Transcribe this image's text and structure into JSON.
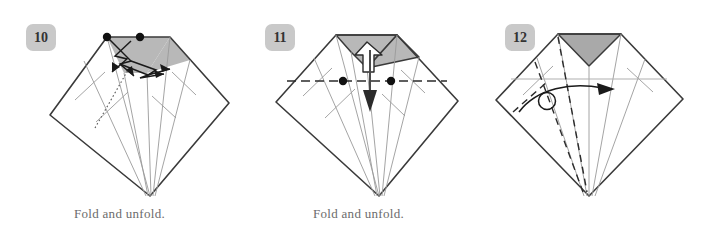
{
  "page": {
    "background_color": "#ffffff",
    "width": 718,
    "height": 242
  },
  "colors": {
    "outline": "#3a3a3a",
    "crease_light": "#9a9a9a",
    "shaded_fill": "#b8b8b8",
    "shaded_fill_dark": "#a9a9a9",
    "dot": "#111111",
    "badge_background": "#c9c9c9",
    "badge_text": "#333333",
    "caption_text": "#6b6b6b",
    "arrow": "#1a1a1a",
    "dashed": "#2b2b2b"
  },
  "steps": [
    {
      "id": "step-10",
      "number": "10",
      "badge_label": "10",
      "caption": "Fold and unfold.",
      "shaded_region": "trapezoid-top",
      "markers": {
        "dots": 2,
        "dot_labels": [
          "left-reference-dot",
          "right-reference-dot"
        ]
      },
      "arrows": [
        {
          "name": "fold-arrow-left",
          "type": "valley-zigzag"
        },
        {
          "name": "fold-arrow-right",
          "type": "valley-zigzag"
        }
      ],
      "dotted_crease": true
    },
    {
      "id": "step-11",
      "number": "11",
      "badge_label": "11",
      "caption": "Fold and unfold.",
      "shaded_region": "notched-top",
      "markers": {
        "dots": 2,
        "dot_labels": [
          "left-reference-dot",
          "right-reference-dot"
        ]
      },
      "arrows": [
        {
          "name": "unfold-arrow-up",
          "type": "hollow-up"
        },
        {
          "name": "fold-arrow-down",
          "type": "solid-down"
        }
      ],
      "dashed_line": "horizontal-valley-fold"
    },
    {
      "id": "step-12",
      "number": "12",
      "badge_label": "12",
      "caption": "",
      "shaded_region": "chevron-top",
      "markers": {
        "dots": 0,
        "dot_labels": []
      },
      "arrows": [
        {
          "name": "rotate-arrow-right",
          "type": "curved-right"
        }
      ],
      "dashed_line": "diagonal-mountain-folds",
      "circle_marker": "pivot-circle"
    }
  ]
}
